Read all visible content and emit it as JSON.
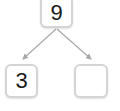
{
  "diagram": {
    "type": "number-bond-tree",
    "root": {
      "value": "9"
    },
    "children": [
      {
        "value": "3"
      },
      {
        "value": ""
      }
    ],
    "colors": {
      "node_border": "#d4d4d4",
      "edge": "#a8a8a8",
      "text": "#1a1a1a",
      "background": "#ffffff"
    }
  }
}
